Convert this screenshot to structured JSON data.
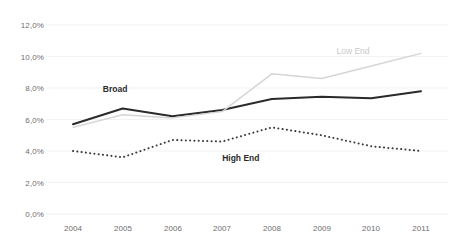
{
  "chart_data": {
    "type": "line",
    "title": "",
    "subtitle": "",
    "xlabel": "",
    "ylabel": "",
    "categories": [
      "2004",
      "2005",
      "2006",
      "2007",
      "2008",
      "2009",
      "2010",
      "2011"
    ],
    "x": [
      2004,
      2005,
      2006,
      2007,
      2008,
      2009,
      2010,
      2011
    ],
    "ylim": [
      0.0,
      12.0
    ],
    "yticks": [
      0.0,
      2.0,
      4.0,
      6.0,
      8.0,
      10.0,
      12.0
    ],
    "ytick_labels": [
      "0,0%",
      "2,0%",
      "4,0%",
      "6,0%",
      "8,0%",
      "10,0%",
      "12,0%"
    ],
    "y_unit": "%",
    "decimal_separator": ",",
    "grid": true,
    "legend_position": "inline-annotations",
    "series": [
      {
        "name": "Broad",
        "values": [
          5.7,
          6.7,
          6.2,
          6.6,
          7.3,
          7.45,
          7.35,
          7.8
        ],
        "color": "#2b2b2b",
        "style": "solid",
        "width": 2.0,
        "label_x": 2004.6,
        "label_y": 7.9
      },
      {
        "name": "Low End",
        "values": [
          5.5,
          6.3,
          6.1,
          6.5,
          8.9,
          8.6,
          9.4,
          10.2
        ],
        "color": "#d5d5d5",
        "style": "solid",
        "width": 1.4,
        "label_x": 2009.3,
        "label_y": 10.3
      },
      {
        "name": "High End",
        "values": [
          4.0,
          3.6,
          4.7,
          4.6,
          5.5,
          5.0,
          4.3,
          4.0
        ],
        "color": "#3a3a3a",
        "style": "dotted",
        "width": 2.0,
        "label_x": 2007.0,
        "label_y": 3.5
      }
    ],
    "annotations": [
      {
        "text": "Broad",
        "series": "Broad"
      },
      {
        "text": "Low End",
        "series": "Low End"
      },
      {
        "text": "High End",
        "series": "High End"
      }
    ]
  },
  "axes": {
    "y_labels": [
      "12,0%",
      "10,0%",
      "8,0%",
      "6,0%",
      "4,0%",
      "2,0%",
      "0,0%"
    ],
    "x_labels": [
      "2004",
      "2005",
      "2006",
      "2007",
      "2008",
      "2009",
      "2010",
      "2011"
    ]
  },
  "colors": {
    "broad": "#2b2b2b",
    "low_end": "#d5d5d5",
    "high_end": "#3a3a3a",
    "axis_text": "#6e6e6e",
    "grid": "#f0f0f0",
    "background": "#ffffff"
  }
}
